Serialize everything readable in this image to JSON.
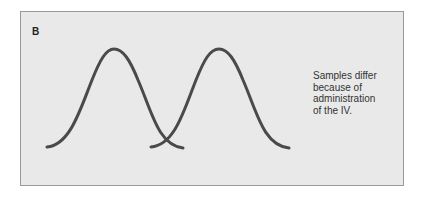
{
  "figure": {
    "panel_label": "B",
    "caption_lines": [
      "Samples differ",
      "because of",
      "administration",
      "of the IV."
    ],
    "colors": {
      "panel_background": "#e9e9e9",
      "panel_border": "#9a9a9a",
      "curve_stroke": "#4a4a4a",
      "text": "#333333"
    },
    "curves": [
      {
        "name": "sample-1",
        "start": [
          47,
          147
        ],
        "peak": [
          114,
          49
        ],
        "end": [
          183,
          148
        ]
      },
      {
        "name": "sample-2",
        "start": [
          151,
          147
        ],
        "peak": [
          219,
          49
        ],
        "end": [
          289,
          148
        ]
      }
    ]
  }
}
